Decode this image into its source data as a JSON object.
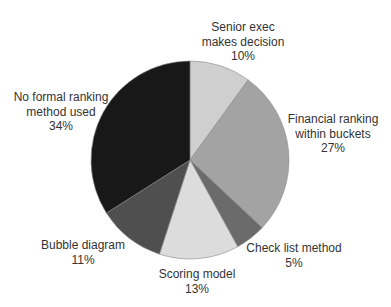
{
  "chart_data": {
    "type": "pie",
    "title": "",
    "start_angle_deg": 0,
    "direction": "clockwise",
    "center": [
      190,
      160
    ],
    "radius": 99,
    "slices": [
      {
        "label": "Senior exec makes decision",
        "value": 10,
        "display": "10%",
        "color": "#cfcfcf",
        "label_lines": [
          "Senior exec",
          "makes decision",
          "10%"
        ],
        "label_pos": [
          243,
          20
        ]
      },
      {
        "label": "Financial ranking within buckets",
        "value": 27,
        "display": "27%",
        "color": "#a3a3a3",
        "label_lines": [
          "Financial ranking",
          "within buckets",
          "27%"
        ],
        "label_pos": [
          333,
          112
        ]
      },
      {
        "label": "Check list method",
        "value": 5,
        "display": "5%",
        "color": "#6b6b6b",
        "label_lines": [
          "Check list method",
          "5%"
        ],
        "label_pos": [
          294,
          241
        ]
      },
      {
        "label": "Scoring model",
        "value": 13,
        "display": "13%",
        "color": "#dcdcdc",
        "label_lines": [
          "Scoring model",
          "13%"
        ],
        "label_pos": [
          197,
          267
        ]
      },
      {
        "label": "Bubble diagram",
        "value": 11,
        "display": "11%",
        "color": "#4f4f4f",
        "label_lines": [
          "Bubble diagram",
          "11%"
        ],
        "label_pos": [
          83,
          238
        ]
      },
      {
        "label": "No formal ranking method used",
        "value": 34,
        "display": "34%",
        "color": "#181818",
        "label_lines": [
          "No formal ranking",
          "method used",
          "34%"
        ],
        "label_pos": [
          61,
          90
        ]
      }
    ],
    "legend": "none",
    "xlabel": "",
    "ylabel": ""
  }
}
